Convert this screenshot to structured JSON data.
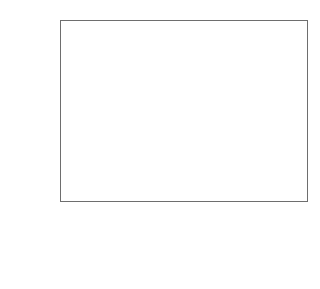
{
  "chart_data": {
    "type": "bar",
    "xlabel": "",
    "ylabel": "mittlerer Trend in %/a",
    "categories": [
      "2000 bis 2014",
      "2014 bis 2021",
      "2021 bis 2030"
    ],
    "series": [
      {
        "name": "Energieintensität, kWh/$",
        "color": "#c6c6c6",
        "values": [
          -2.1,
          -2.0,
          -0.4
        ]
      },
      {
        "name": "CO2-Intensität der Energie, g CO2/kWh",
        "color": "#2f2f2f",
        "values": [
          1.4,
          -2.4,
          -1.6
        ]
      },
      {
        "name": "CO2-Nachhaltigkeitsindex, g CO2/$",
        "color": "#3d3d3d",
        "values": [
          -1.0,
          -3.2,
          -2.0
        ]
      }
    ],
    "ylim": [
      -4.5,
      1.5
    ],
    "yticks": [
      1.5,
      1.0,
      0.5,
      0.0,
      -0.5,
      -1.0,
      -1.5,
      -2.0,
      -2.5,
      -3.0,
      -3.5,
      -4.0,
      -4.5
    ],
    "ytick_labels": [
      "1.5",
      "1.0",
      "0.5",
      "0.0",
      "-0.5",
      "-1.0",
      "-1.5",
      "-2.0",
      "-2.5",
      "-3.0",
      "-3.5",
      "-4.0",
      "-4.5"
    ],
    "grid": true,
    "legend_position": "bottom"
  },
  "legend": {
    "items": [
      {
        "label_pre": "Energieintensität, kWh/$",
        "label_sub1": "",
        "label_mid": "",
        "label_sub2": "",
        "label_post": ""
      },
      {
        "label_pre": "CO",
        "label_sub1": "2",
        "label_mid": "-Intensität der Energie, g CO",
        "label_sub2": "2",
        "label_post": "/kWh"
      },
      {
        "label_pre": "CO",
        "label_sub1": "2",
        "label_mid": "-Nachhaltigkeitsindex, g CO",
        "label_sub2": "2",
        "label_post": "/$"
      }
    ]
  }
}
